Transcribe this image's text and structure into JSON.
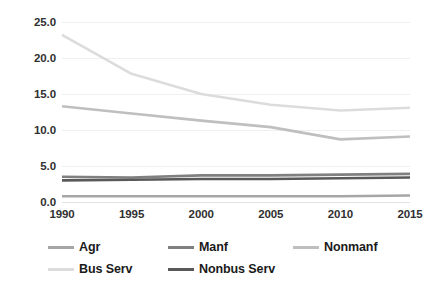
{
  "chart_data": {
    "type": "line",
    "title": "",
    "subtitle": "",
    "xlabel": "",
    "ylabel": "",
    "x": [
      1990,
      1995,
      2000,
      2005,
      2010,
      2015
    ],
    "categories": [
      "1990",
      "1995",
      "2000",
      "2005",
      "2010",
      "2015"
    ],
    "xtick_labels": [
      "1990",
      "1995",
      "2000",
      "2005",
      "2010",
      "2015"
    ],
    "ytick_labels": [
      "0.0",
      "5.0",
      "10.0",
      "15.0",
      "20.0",
      "25.0"
    ],
    "ytick_values": [
      0.0,
      5.0,
      10.0,
      15.0,
      20.0,
      25.0
    ],
    "ylim": [
      0.0,
      25.0
    ],
    "xlim": [
      1990,
      2015
    ],
    "grid": true,
    "grid_axis": "y",
    "legend_position": "bottom",
    "legend_columns": 3,
    "series": [
      {
        "name": "Agr",
        "color": "#a6a6a6",
        "values": [
          0.8,
          0.8,
          0.8,
          0.8,
          0.8,
          0.9
        ]
      },
      {
        "name": "Manf",
        "color": "#808080",
        "values": [
          3.5,
          3.4,
          3.7,
          3.7,
          3.8,
          3.9
        ]
      },
      {
        "name": "Nonmanf",
        "color": "#bfbfbf",
        "values": [
          13.3,
          12.3,
          11.3,
          10.4,
          8.7,
          9.1
        ]
      },
      {
        "name": "Bus Serv",
        "color": "#dcdcdc",
        "values": [
          23.2,
          17.8,
          15.0,
          13.5,
          12.7,
          13.1
        ]
      },
      {
        "name": "Nonbus Serv",
        "color": "#595959",
        "values": [
          3.0,
          3.1,
          3.2,
          3.2,
          3.3,
          3.4
        ]
      }
    ]
  },
  "legend": {
    "items": [
      {
        "label": "Agr",
        "color": "#a6a6a6"
      },
      {
        "label": "Manf",
        "color": "#808080"
      },
      {
        "label": "Nonmanf",
        "color": "#bfbfbf"
      },
      {
        "label": "Bus Serv",
        "color": "#dcdcdc"
      },
      {
        "label": "Nonbus Serv",
        "color": "#595959"
      }
    ]
  },
  "colors": {
    "background": "#ffffff",
    "gridline": "#efefef",
    "tick_text": "#303030",
    "legend_text": "#1a1a1a"
  }
}
